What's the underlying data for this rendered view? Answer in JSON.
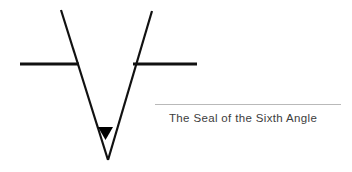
{
  "page": {
    "background_color": "#ffffff",
    "width": 352,
    "height": 172
  },
  "figure": {
    "name": "sixth-angle-sigil",
    "stroke_color": "#111111",
    "fill_color": "#000000",
    "elements": {
      "left_stroke": {
        "x1": 61,
        "y1": 10,
        "x2": 108,
        "y2": 160,
        "width": 2.2
      },
      "right_stroke": {
        "x1": 152,
        "y1": 11,
        "x2": 108,
        "y2": 160,
        "width": 2.2
      },
      "crossbar_left": {
        "x1": 20,
        "y1": 64,
        "x2": 79,
        "y2": 64,
        "width": 3
      },
      "crossbar_right": {
        "x1": 133,
        "y1": 64,
        "x2": 197,
        "y2": 64,
        "width": 3
      },
      "triangle_marker": {
        "left": 98,
        "right": 113,
        "top": 127,
        "apex_y": 140
      }
    }
  },
  "caption": {
    "rule_color": "#b9b9b9",
    "text_color": "#3d3d3d",
    "text": "The Seal of the Sixth Angle"
  }
}
